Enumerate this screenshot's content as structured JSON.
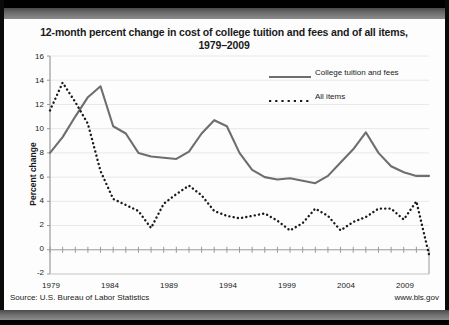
{
  "chart_data": {
    "type": "line",
    "title": "12-month percent change in cost of college tuition and fees and of all items, 1979–2009",
    "title_line1": "12-month percent change in cost of college tuition and fees and of all items,",
    "title_line2": "1979–2009",
    "xlabel": "",
    "ylabel": "Percent change",
    "ylim": [
      -2,
      16
    ],
    "xlim": [
      1979,
      2009
    ],
    "yticks": [
      -2,
      0,
      2,
      4,
      6,
      8,
      10,
      12,
      14,
      16
    ],
    "xticks": [
      1979,
      1984,
      1989,
      1994,
      1999,
      2004,
      2009
    ],
    "grid": true,
    "legend_position": "top-right",
    "x": [
      1979,
      1980,
      1981,
      1982,
      1983,
      1984,
      1985,
      1986,
      1987,
      1988,
      1989,
      1990,
      1991,
      1992,
      1993,
      1994,
      1995,
      1996,
      1997,
      1998,
      1999,
      2000,
      2001,
      2002,
      2003,
      2004,
      2005,
      2006,
      2007,
      2008,
      2009
    ],
    "series": [
      {
        "name": "College tuition and fees",
        "style": "solid",
        "color": "#6e6e6e",
        "values": [
          8.0,
          9.3,
          11.0,
          12.6,
          13.5,
          10.2,
          9.6,
          8.0,
          7.7,
          7.6,
          7.5,
          8.1,
          9.6,
          10.7,
          10.2,
          8.0,
          6.6,
          6.0,
          5.8,
          5.9,
          5.7,
          5.5,
          6.1,
          7.2,
          8.3,
          9.7,
          8.0,
          6.9,
          6.4,
          6.1,
          6.1
        ]
      },
      {
        "name": "All items",
        "style": "dotted",
        "color": "#1a1a1a",
        "values": [
          11.5,
          13.8,
          12.2,
          10.4,
          6.5,
          4.2,
          3.7,
          3.2,
          1.8,
          3.8,
          4.6,
          5.3,
          4.5,
          3.2,
          2.8,
          2.6,
          2.8,
          3.0,
          2.4,
          1.6,
          2.2,
          3.4,
          2.8,
          1.6,
          2.3,
          2.7,
          3.4,
          3.4,
          2.5,
          4.0,
          -0.4
        ]
      }
    ]
  },
  "legend": {
    "items": [
      {
        "label": "College tuition and fees",
        "style": "solid"
      },
      {
        "label": "All items",
        "style": "dotted"
      }
    ]
  },
  "axis": {
    "y_label": "Percent change",
    "y_ticks": [
      "16",
      "14",
      "12",
      "10",
      "8",
      "6",
      "4",
      "2",
      "0",
      "-2"
    ],
    "x_ticks": [
      "1979",
      "1984",
      "1989",
      "1994",
      "1999",
      "2004",
      "2009"
    ]
  },
  "footer": {
    "source": "Source: U.S. Bureau of Labor Statistics",
    "website": "www.bls.gov"
  },
  "colors": {
    "tuition_line": "#6e6e6e",
    "all_items_line": "#1a1a1a",
    "grid": "#e8e8e8",
    "axis": "#9a9a9a",
    "band": "#6e6e6e",
    "text": "#1a1a1a"
  }
}
